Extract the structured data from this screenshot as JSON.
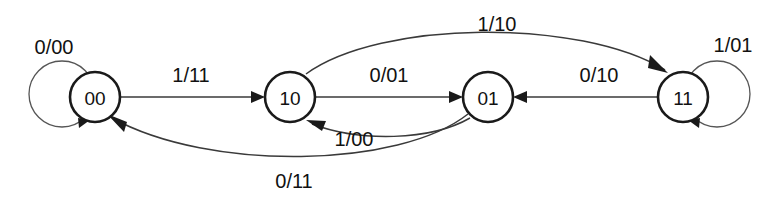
{
  "diagram": {
    "type": "state-transition-diagram",
    "width": 776,
    "height": 198,
    "background_color": "#ffffff",
    "stroke_color": "#1a1a1a",
    "text_color": "#111111",
    "label_format": "input/output",
    "states": [
      {
        "id": "s00",
        "label": "00",
        "cx": 95,
        "cy": 97,
        "r": 25
      },
      {
        "id": "s10",
        "label": "10",
        "cx": 290,
        "cy": 97,
        "r": 25
      },
      {
        "id": "s01",
        "label": "01",
        "cx": 488,
        "cy": 97,
        "r": 25
      },
      {
        "id": "s11",
        "label": "11",
        "cx": 683,
        "cy": 97,
        "r": 25
      }
    ],
    "transitions": [
      {
        "id": "t-00-00",
        "from": "00",
        "to": "00",
        "label": "0/00",
        "input": "0",
        "output": "00",
        "shape": "self-loop-left",
        "label_x": 54,
        "label_y": 54
      },
      {
        "id": "t-00-10",
        "from": "00",
        "to": "10",
        "label": "1/11",
        "input": "1",
        "output": "11",
        "shape": "straight-right",
        "label_x": 191,
        "label_y": 82
      },
      {
        "id": "t-10-01",
        "from": "10",
        "to": "01",
        "label": "0/01",
        "input": "0",
        "output": "01",
        "shape": "straight-right",
        "label_x": 389,
        "label_y": 82
      },
      {
        "id": "t-11-01",
        "from": "11",
        "to": "01",
        "label": "0/10",
        "input": "0",
        "output": "10",
        "shape": "straight-left",
        "label_x": 599,
        "label_y": 82
      },
      {
        "id": "t-11-11",
        "from": "11",
        "to": "11",
        "label": "1/01",
        "input": "1",
        "output": "01",
        "shape": "self-loop-right",
        "label_x": 733,
        "label_y": 52
      },
      {
        "id": "t-10-11",
        "from": "10",
        "to": "11",
        "label": "1/10",
        "input": "1",
        "output": "10",
        "shape": "arc-above",
        "label_x": 497,
        "label_y": 31
      },
      {
        "id": "t-01-10",
        "from": "01",
        "to": "10",
        "label": "1/00",
        "input": "1",
        "output": "00",
        "shape": "arc-below-short",
        "label_x": 354,
        "label_y": 146
      },
      {
        "id": "t-01-00",
        "from": "01",
        "to": "00",
        "label": "0/11",
        "input": "0",
        "output": "11",
        "shape": "arc-below-long",
        "label_x": 294,
        "label_y": 188
      }
    ]
  }
}
